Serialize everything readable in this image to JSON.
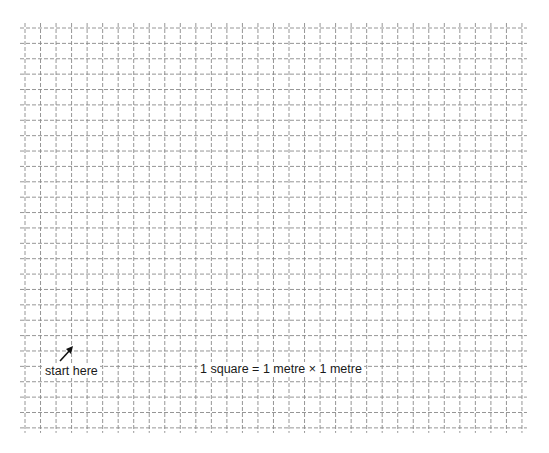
{
  "diagram": {
    "type": "square-grid",
    "columns": 32,
    "rows": 26,
    "grid_left": 25,
    "grid_top": 28,
    "cell_width": 15.53,
    "cell_height": 15.38,
    "line_overhang": 5,
    "line_color": "#8a8a8a",
    "line_style": "dashed"
  },
  "labels": {
    "start": "start here",
    "scale": "1 square = 1 metre × 1 metre"
  },
  "icons": {
    "start_arrow": "arrow-up-right-icon"
  }
}
